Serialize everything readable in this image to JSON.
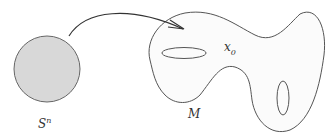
{
  "diagram": {
    "sphere": {
      "label_base": "S",
      "label_sup": "n",
      "fill": "#d8d8d8",
      "stroke": "#666666"
    },
    "manifold": {
      "label": "M",
      "fill": "#fbfbfb",
      "stroke": "#555555",
      "holes": 2
    },
    "basepoint": {
      "label_base": "x",
      "label_sub": "0"
    },
    "arrow": {
      "from": "sphere",
      "to": "manifold",
      "stroke": "#333333"
    }
  }
}
